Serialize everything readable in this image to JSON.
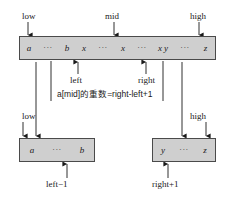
{
  "diagram": {
    "colors": {
      "array_fill": "#cfcfcf",
      "array_border": "#4a4a4a",
      "arrow": "#1a1a1a",
      "text": "#1a1a1a"
    },
    "top_array": {
      "cells": [
        "a",
        "···",
        "b",
        "x",
        "···",
        "x",
        "···",
        "x y",
        "···",
        "z"
      ]
    },
    "left_array": {
      "cells": [
        "a",
        "···",
        "b"
      ]
    },
    "right_array": {
      "cells": [
        "y",
        "···",
        "z"
      ]
    },
    "labels": {
      "low_top": "low",
      "mid_top": "mid",
      "high_top": "high",
      "left": "left",
      "right": "right",
      "low_bottom": "low",
      "high_bottom": "high",
      "left_minus_1": "left−1",
      "right_plus_1": "right+1"
    },
    "formula": "a[mid]的重数=right-left+1"
  }
}
